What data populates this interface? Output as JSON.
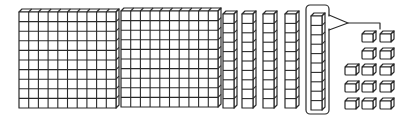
{
  "diagram": {
    "description": "Base-ten blocks: 2 hundreds flats, 5 tens rods (one boxed and regrouped into units), 13 unit cubes",
    "colors": {
      "stroke": "#2a2a2a",
      "fill": "#ffffff",
      "background": "#ffffff"
    },
    "flats": [
      {
        "id": "flat-1",
        "value": 100,
        "x": 19,
        "y": 9,
        "w": 97,
        "h": 99,
        "cols": 10,
        "rows": 10
      },
      {
        "id": "flat-2",
        "value": 100,
        "x": 121,
        "y": 8,
        "w": 97,
        "h": 99,
        "cols": 10,
        "rows": 10
      }
    ],
    "rods": [
      {
        "id": "rod-1",
        "value": 10,
        "x": 223,
        "y": 11,
        "w": 11,
        "h": 97,
        "cubes": 10,
        "boxed": false
      },
      {
        "id": "rod-2",
        "value": 10,
        "x": 242,
        "y": 11,
        "w": 11,
        "h": 97,
        "cubes": 10,
        "boxed": false
      },
      {
        "id": "rod-3",
        "value": 10,
        "x": 263,
        "y": 11,
        "w": 11,
        "h": 97,
        "cubes": 10,
        "boxed": false
      },
      {
        "id": "rod-4",
        "value": 10,
        "x": 285,
        "y": 11,
        "w": 11,
        "h": 97,
        "cubes": 10,
        "boxed": false
      },
      {
        "id": "rod-5",
        "value": 10,
        "x": 311,
        "y": 13,
        "w": 11,
        "h": 97,
        "cubes": 10,
        "boxed": true
      }
    ],
    "box": {
      "x": 306,
      "y": 5,
      "w": 23,
      "h": 109,
      "r": 4
    },
    "callout": {
      "triangle": [
        [
          329,
          15
        ],
        [
          348,
          23
        ],
        [
          329,
          30
        ]
      ],
      "line": [
        [
          348,
          23
        ],
        [
          380,
          23
        ],
        [
          380,
          29
        ]
      ]
    },
    "units": {
      "count": 13,
      "size": 11,
      "cubes": [
        {
          "x": 362,
          "y": 31
        },
        {
          "x": 380,
          "y": 31
        },
        {
          "x": 362,
          "y": 48
        },
        {
          "x": 380,
          "y": 48
        },
        {
          "x": 345,
          "y": 64
        },
        {
          "x": 362,
          "y": 64
        },
        {
          "x": 380,
          "y": 64
        },
        {
          "x": 345,
          "y": 81
        },
        {
          "x": 362,
          "y": 81
        },
        {
          "x": 380,
          "y": 81
        },
        {
          "x": 345,
          "y": 98
        },
        {
          "x": 362,
          "y": 98
        },
        {
          "x": 380,
          "y": 98
        }
      ]
    },
    "totals": {
      "hundreds": 2,
      "tens": 5,
      "ones": 13
    }
  }
}
